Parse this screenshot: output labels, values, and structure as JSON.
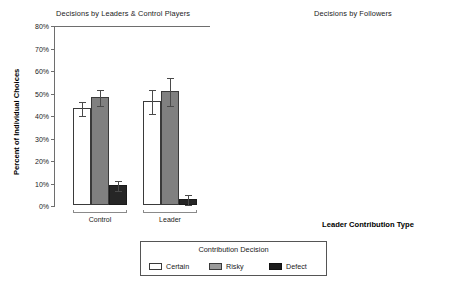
{
  "figure": {
    "legend": {
      "title": "Contribution Decision",
      "items": [
        {
          "label": "Certain",
          "swatch": "certain",
          "color": "#ffffff"
        },
        {
          "label": "Risky",
          "swatch": "risky",
          "color": "#808080"
        },
        {
          "label": "Defect",
          "swatch": "defect",
          "color": "#262626"
        }
      ]
    }
  },
  "chart_data": [
    {
      "type": "bar",
      "title": "Decisions by Leaders & Control Players",
      "xlabel": "",
      "ylabel": "Percent of Individual Choices",
      "ylim": [
        0,
        80
      ],
      "ytick_labels": [
        "0%",
        "10%",
        "20%",
        "30%",
        "40%",
        "50%",
        "60%",
        "70%",
        "80%"
      ],
      "ytick_values": [
        0,
        10,
        20,
        30,
        40,
        50,
        60,
        70,
        80
      ],
      "grid": false,
      "legend_position": "bottom-center-shared",
      "categories": [
        "Control",
        "Leader"
      ],
      "series": [
        {
          "name": "Certain",
          "values": [
            43.0,
            46.2
          ],
          "errors": [
            3.2,
            5.5
          ]
        },
        {
          "name": "Risky",
          "values": [
            48.0,
            50.8
          ],
          "errors": [
            3.5,
            6.2
          ]
        },
        {
          "name": "Defect",
          "values": [
            9.0,
            2.8
          ],
          "errors": [
            2.2,
            2.2
          ]
        }
      ]
    },
    {
      "type": "bar",
      "title": "Decisions by Followers",
      "xlabel": "Leader Contribution Type",
      "ylabel": "Percent of Individual Choices",
      "ylim": [
        0,
        80
      ],
      "ytick_labels": [
        "0%",
        "10%",
        "20%",
        "30%",
        "40%",
        "50%",
        "60%",
        "70%",
        "80%"
      ],
      "ytick_values": [
        0,
        10,
        20,
        30,
        40,
        50,
        60,
        70,
        80
      ],
      "grid": false,
      "legend_position": "bottom-center-shared",
      "categories": [
        "Certain",
        "Risky",
        "Defect"
      ],
      "series": [
        {
          "name": "Certain",
          "values": [
            53.0,
            35.5,
            29.0
          ],
          "errors": [
            3.4,
            3.5,
            3.0
          ]
        },
        {
          "name": "Risky",
          "values": [
            36.5,
            52.0,
            42.0
          ],
          "errors": [
            3.6,
            3.2,
            4.0
          ]
        },
        {
          "name": "Defect",
          "values": [
            10.5,
            13.0,
            29.5
          ],
          "errors": [
            2.6,
            2.4,
            3.4
          ]
        }
      ]
    }
  ]
}
